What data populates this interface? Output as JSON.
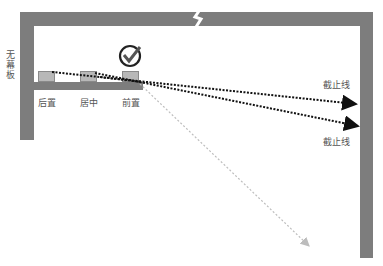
{
  "diagram": {
    "left_label": "无幕板",
    "positions": [
      {
        "label": "后置",
        "x": 38
      },
      {
        "label": "居中",
        "x": 80
      },
      {
        "label": "前置",
        "x": 122
      }
    ],
    "cutoff_labels": [
      "截止线",
      "截止线"
    ],
    "selected_position": "前置",
    "icons": {
      "check": "check-circle-icon",
      "lightning": "lightning-icon"
    },
    "colors": {
      "wall": "#7d7d7d",
      "speaker_fill": "#b8b8b8",
      "arrow_dark": "#111111",
      "arrow_light": "#bdbdbd"
    }
  }
}
